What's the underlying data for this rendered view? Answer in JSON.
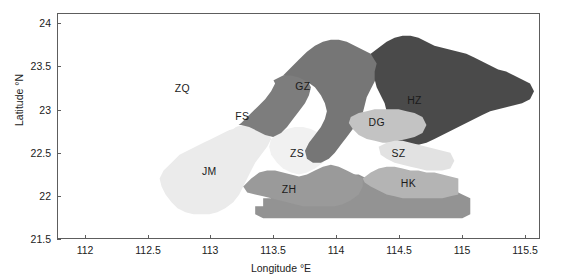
{
  "chart_data": {
    "type": "map",
    "title": "",
    "xlabel": "Longitude °E",
    "ylabel": "Latitude °N",
    "xlim": [
      111.78,
      115.62
    ],
    "ylim": [
      21.5,
      24.12
    ],
    "xticks": [
      "112",
      "112.5",
      "113",
      "113.5",
      "114",
      "114.5",
      "115",
      "115.5"
    ],
    "xtick_values": [
      112,
      112.5,
      113,
      113.5,
      114,
      114.5,
      115,
      115.5
    ],
    "yticks": [
      "21.5",
      "22",
      "22.5",
      "23",
      "23.5",
      "24"
    ],
    "ytick_values": [
      21.5,
      22,
      22.5,
      23,
      23.5,
      24
    ],
    "grid": false,
    "legend": "none",
    "regions": [
      {
        "code": "ZQ",
        "label": "ZQ",
        "color": "#ffffff",
        "lon": 112.61,
        "lat": 23.22
      },
      {
        "code": "FS",
        "label": "FS",
        "color": "#7d7d7d",
        "lon": 112.96,
        "lat": 22.99
      },
      {
        "code": "GZ",
        "label": "GZ",
        "color": "#767676",
        "lon": 113.44,
        "lat": 23.27
      },
      {
        "code": "HZ",
        "label": "HZ",
        "color": "#4a4a4a",
        "lon": 114.33,
        "lat": 23.24
      },
      {
        "code": "DG",
        "label": "DG",
        "color": "#c3c3c3",
        "lon": 113.88,
        "lat": 22.99
      },
      {
        "code": "SZ",
        "label": "SZ",
        "color": "#e2e2e2",
        "lon": 114.05,
        "lat": 22.72
      },
      {
        "code": "HK",
        "label": "HK",
        "color": "#b4b4b4",
        "lon": 114.18,
        "lat": 22.41
      },
      {
        "code": "ZS",
        "label": "ZS",
        "color": "#f1f1f1",
        "lon": 113.36,
        "lat": 22.58
      },
      {
        "code": "ZH",
        "label": "ZH",
        "color": "#9a9a9a",
        "lon": 113.41,
        "lat": 22.21
      },
      {
        "code": "JM",
        "label": "JM",
        "color": "#ebebeb",
        "lon": 112.9,
        "lat": 22.37
      },
      {
        "code": "SEA",
        "label": "",
        "color": "#939393",
        "lon": 113.8,
        "lat": 21.95
      }
    ]
  },
  "axes": {
    "x_title": "Longitude °E",
    "y_title": "Latitude °N",
    "x_tick_labels": [
      "112",
      "112.5",
      "113",
      "113.5",
      "114",
      "114.5",
      "115",
      "115.5"
    ],
    "y_tick_labels": [
      "21.5",
      "22",
      "22.5",
      "23",
      "23.5",
      "24"
    ]
  },
  "map_labels": {
    "zq": "ZQ",
    "fs": "FS",
    "gz": "GZ",
    "hz": "HZ",
    "dg": "DG",
    "sz": "SZ",
    "hk": "HK",
    "zs": "ZS",
    "zh": "ZH",
    "jm": "JM"
  },
  "colors": {
    "frame": "#5d5d5d",
    "text": "#1b1b1b",
    "background": "#ffffff"
  }
}
